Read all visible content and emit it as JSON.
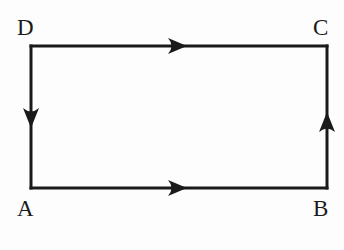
{
  "figure": {
    "type": "geometry-diagram",
    "background_color": "#fdfdfd",
    "stroke_color": "#1a1a1a",
    "stroke_width": 3,
    "canvas": {
      "width": 344,
      "height": 250
    }
  },
  "shape": {
    "name": "rectangle",
    "left": 31,
    "top": 46,
    "right": 327,
    "bottom": 188,
    "width": 296,
    "height": 142
  },
  "vertices": [
    {
      "id": "D",
      "label": "D",
      "corner": "top-left",
      "x": 31,
      "y": 46,
      "label_x": 17,
      "label_y": 16
    },
    {
      "id": "C",
      "label": "C",
      "corner": "top-right",
      "x": 327,
      "y": 46,
      "label_x": 313,
      "label_y": 16
    },
    {
      "id": "A",
      "label": "A",
      "corner": "bottom-left",
      "x": 31,
      "y": 188,
      "label_x": 17,
      "label_y": 197
    },
    {
      "id": "B",
      "label": "B",
      "corner": "bottom-right",
      "x": 327,
      "y": 188,
      "label_x": 313,
      "label_y": 197
    }
  ],
  "edges": [
    {
      "id": "DC",
      "from": "D",
      "to": "C",
      "side": "top",
      "direction": "right",
      "arrow_tip_x": 187,
      "arrow_tip_y": 46
    },
    {
      "id": "AB",
      "from": "A",
      "to": "B",
      "side": "bottom",
      "direction": "right",
      "arrow_tip_x": 187,
      "arrow_tip_y": 188
    },
    {
      "id": "DA",
      "from": "D",
      "to": "A",
      "side": "left",
      "direction": "down",
      "arrow_tip_x": 31,
      "arrow_tip_y": 128
    },
    {
      "id": "BC",
      "from": "B",
      "to": "C",
      "side": "right",
      "direction": "up",
      "arrow_tip_x": 327,
      "arrow_tip_y": 112
    }
  ],
  "labels": {
    "D": "D",
    "C": "C",
    "A": "A",
    "B": "B"
  }
}
